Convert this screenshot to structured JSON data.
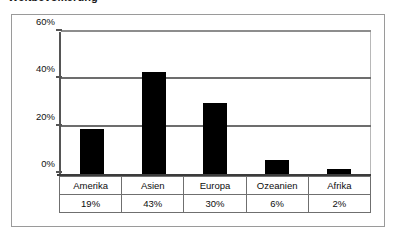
{
  "heading": "Weltbevölkerung",
  "colors": {
    "bar": "#000000",
    "gridline": "#6d6d6d",
    "axis": "#3b3b3b",
    "frame": "#9a9a9a",
    "plot_background": "#ffffff",
    "text": "#0d0d0d"
  },
  "chart_data": {
    "type": "bar",
    "title": "Weltbevölkerung",
    "xlabel": "",
    "ylabel": "",
    "categories": [
      "Amerika",
      "Asien",
      "Europa",
      "Ozeanien",
      "Afrika"
    ],
    "values": [
      19,
      43,
      30,
      6,
      2
    ],
    "value_labels": [
      "19%",
      "43%",
      "30%",
      "6%",
      "2%"
    ],
    "ylim": [
      0,
      60
    ],
    "yticks": [
      0,
      20,
      40,
      60
    ],
    "ytick_labels": [
      "0%",
      "20%",
      "40%",
      "60%"
    ],
    "grid": true,
    "legend": null,
    "legend_position": "none",
    "series": [
      {
        "name": "Anteil",
        "values": [
          19,
          43,
          30,
          6,
          2
        ]
      }
    ]
  },
  "table": {
    "category_row": [
      "Amerika",
      "Asien",
      "Europa",
      "Ozeanien",
      "Afrika"
    ],
    "value_row": [
      "19%",
      "43%",
      "30%",
      "6%",
      "2%"
    ]
  }
}
